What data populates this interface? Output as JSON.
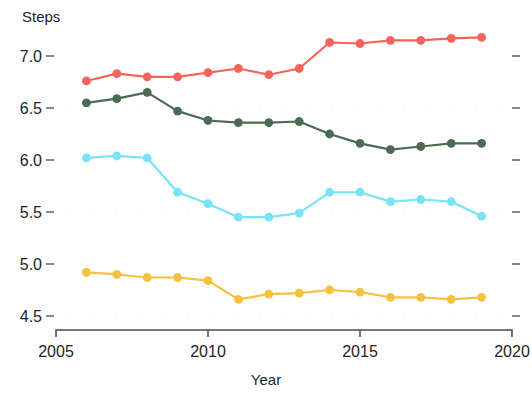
{
  "chart_data": {
    "type": "line",
    "title": "",
    "subtitle": "",
    "xlabel": "Year",
    "ylabel": "Steps",
    "xlim": [
      2005,
      2020
    ],
    "ylim": [
      4.35,
      7.35
    ],
    "x_ticks": [
      2005,
      2010,
      2015,
      2020
    ],
    "x_tick_labels": [
      "2005",
      "2010",
      "2015",
      "2020"
    ],
    "y_ticks": [
      4.5,
      5.0,
      5.5,
      6.0,
      6.5,
      7.0
    ],
    "y_tick_labels": [
      "4.5",
      "5.0",
      "5.5",
      "6.0",
      "6.5",
      "7.0"
    ],
    "grid": false,
    "legend": "none",
    "x": [
      2006,
      2007,
      2008,
      2009,
      2010,
      2011,
      2012,
      2013,
      2014,
      2015,
      2016,
      2017,
      2018,
      2019
    ],
    "series": [
      {
        "name": "red-series",
        "color": "#f4645a",
        "marker": "circle",
        "values": [
          6.76,
          6.83,
          6.8,
          6.8,
          6.84,
          6.88,
          6.82,
          6.88,
          7.13,
          7.12,
          7.15,
          7.15,
          7.17,
          7.18
        ]
      },
      {
        "name": "dark-green-series",
        "color": "#4c6b52",
        "marker": "circle",
        "values": [
          6.55,
          6.59,
          6.65,
          6.47,
          6.38,
          6.36,
          6.36,
          6.37,
          6.25,
          6.16,
          6.1,
          6.13,
          6.16,
          6.16
        ]
      },
      {
        "name": "cyan-series",
        "color": "#79e4f5",
        "marker": "circle",
        "values": [
          6.02,
          6.04,
          6.02,
          5.69,
          5.58,
          5.45,
          5.45,
          5.49,
          5.69,
          5.69,
          5.6,
          5.62,
          5.6,
          5.46
        ]
      },
      {
        "name": "gold-series",
        "color": "#f6c13f",
        "marker": "circle",
        "values": [
          4.92,
          4.9,
          4.87,
          4.87,
          4.84,
          4.66,
          4.71,
          4.72,
          4.75,
          4.73,
          4.68,
          4.68,
          4.66,
          4.68
        ]
      }
    ]
  },
  "labels": {
    "y_axis_title": "Steps",
    "x_axis_title": "Year"
  }
}
